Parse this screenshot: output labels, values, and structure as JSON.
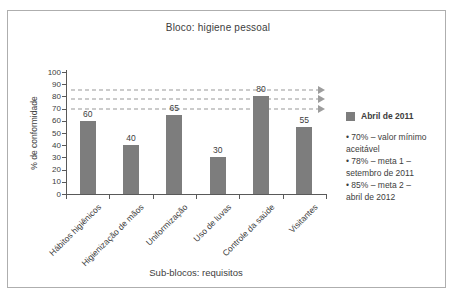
{
  "window": {
    "border_color": "#aeaeae",
    "background": "#ffffff"
  },
  "chart_data": {
    "type": "bar",
    "title": "Bloco: higiene pessoal",
    "categories": [
      "Hábitos higiênicos",
      "Higienização de mãos",
      "Uniformização",
      "Uso de luvas",
      "Controle da saúde",
      "Visitantes"
    ],
    "values": [
      60,
      40,
      65,
      30,
      80,
      55
    ],
    "xlabel": "Sub-blocos: requisitos",
    "ylabel": "% de conformidade",
    "ylim": [
      0,
      100
    ],
    "ytick_step": 10,
    "reference_lines": [
      {
        "value": 70,
        "style": "dashed-arrow"
      },
      {
        "value": 78,
        "style": "dashed-arrow"
      },
      {
        "value": 85,
        "style": "dashed-arrow"
      }
    ],
    "bar_color": "#7d7d7d",
    "reference_line_color": "#cbcbcb",
    "axis_color": "#595959",
    "grid": false,
    "legend_position": "right",
    "data_labels": true
  },
  "legend": {
    "series_label": "Abril de 2011",
    "swatch_color": "#7d7d7d",
    "bullet": "•",
    "notes": [
      "70% – valor mínimo aceitável",
      "78% – meta 1 – setembro de 2011",
      "85% – meta 2 – abril de 2012"
    ]
  }
}
